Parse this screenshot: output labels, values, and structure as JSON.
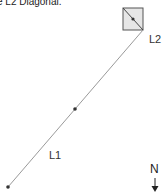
{
  "caption": "e L2 Diagonal.",
  "lines": [
    {
      "id": "L1",
      "label": "L1"
    },
    {
      "id": "L2",
      "label": "L2"
    }
  ],
  "north_label": "N",
  "colors": {
    "line": "#9a9a9a",
    "box_fill": "#e6e6e6",
    "box_stroke": "#555555",
    "point": "#333333"
  }
}
